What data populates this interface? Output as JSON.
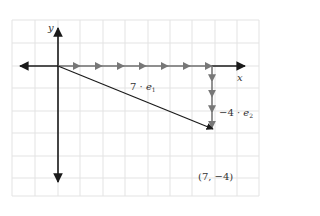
{
  "diagram": {
    "grid": {
      "color": "#e3e3e3",
      "x_lines": [
        12,
        35,
        58,
        80,
        103,
        125,
        148,
        170,
        192,
        215,
        237,
        259
      ],
      "y_lines": [
        20,
        43,
        66,
        88,
        111,
        133,
        156,
        178,
        196
      ]
    },
    "axes": {
      "color": "#1a1a1a",
      "x_label": "x",
      "y_label": "y"
    },
    "vectors": {
      "horizontal": {
        "label_coef": "7 · ",
        "label_var": "e",
        "label_sub": "1",
        "scalar": 7,
        "basis": "e1",
        "segments": 7,
        "color": "#777777"
      },
      "vertical": {
        "label_coef": "−4 · ",
        "label_var": "e",
        "label_sub": "2",
        "scalar": -4,
        "basis": "e2",
        "segments": 4,
        "color": "#777777"
      },
      "resultant": {
        "color": "#1a1a1a"
      }
    },
    "point": {
      "label": "(7, −4)",
      "x": 7,
      "y": -4
    }
  }
}
